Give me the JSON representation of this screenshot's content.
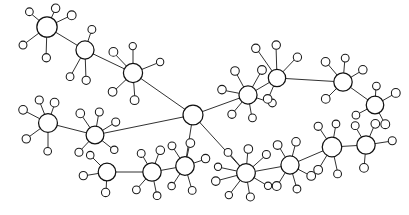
{
  "diagram": {
    "type": "node-link-graph",
    "background_color": "#ffffff",
    "edge_color": "#1a1a1a",
    "hub_fill": "#ffffff",
    "hub_stroke": "#111111",
    "leaf_fill": "#ffffff",
    "leaf_stroke": "#1a1a1a",
    "canvas": {
      "width": 409,
      "height": 215
    },
    "hub_radius": 9,
    "leaf_radius": 4,
    "hub_count": 17,
    "leaf_count": 96,
    "hubs": [
      {
        "id": "h1",
        "label": "hub-top-left",
        "cx": 47,
        "cy": 27,
        "r": 10
      },
      {
        "id": "h2",
        "label": "hub-upper-left-mid",
        "cx": 85,
        "cy": 50,
        "r": 9
      },
      {
        "id": "h3",
        "label": "hub-upper-center",
        "cx": 133,
        "cy": 73,
        "r": 9.5
      },
      {
        "id": "h4",
        "label": "hub-center",
        "cx": 193,
        "cy": 115,
        "r": 10
      },
      {
        "id": "h5",
        "label": "hub-upper-right-inner",
        "cx": 248,
        "cy": 95,
        "r": 9
      },
      {
        "id": "h6",
        "label": "hub-upper-right",
        "cx": 277,
        "cy": 78,
        "r": 9
      },
      {
        "id": "h7",
        "label": "hub-right-top",
        "cx": 343,
        "cy": 82,
        "r": 9
      },
      {
        "id": "h8",
        "label": "hub-far-right",
        "cx": 375,
        "cy": 105,
        "r": 8.5
      },
      {
        "id": "h9",
        "label": "hub-left-mid",
        "cx": 48,
        "cy": 123,
        "r": 9.5
      },
      {
        "id": "h10",
        "label": "hub-left-lower-mid",
        "cx": 95,
        "cy": 135,
        "r": 9
      },
      {
        "id": "h11",
        "label": "hub-bottom-left",
        "cx": 107,
        "cy": 172,
        "r": 9
      },
      {
        "id": "h12",
        "label": "hub-bottom-center-l",
        "cx": 152,
        "cy": 172,
        "r": 9
      },
      {
        "id": "h13",
        "label": "hub-bottom-center",
        "cx": 185,
        "cy": 166,
        "r": 9
      },
      {
        "id": "h14",
        "label": "hub-bottom-center-r",
        "cx": 246,
        "cy": 173,
        "r": 9.5
      },
      {
        "id": "h15",
        "label": "hub-bottom-right-mid",
        "cx": 290,
        "cy": 165,
        "r": 9
      },
      {
        "id": "h16",
        "label": "hub-bottom-right",
        "cx": 332,
        "cy": 147,
        "r": 9.5
      },
      {
        "id": "h17",
        "label": "hub-far-bottom-right",
        "cx": 366,
        "cy": 145,
        "r": 9
      }
    ],
    "hub_edges": [
      {
        "from": "h1",
        "to": "h2"
      },
      {
        "from": "h2",
        "to": "h3"
      },
      {
        "from": "h3",
        "to": "h4"
      },
      {
        "from": "h4",
        "to": "h5"
      },
      {
        "from": "h5",
        "to": "h6"
      },
      {
        "from": "h6",
        "to": "h7"
      },
      {
        "from": "h7",
        "to": "h8"
      },
      {
        "from": "h9",
        "to": "h10"
      },
      {
        "from": "h10",
        "to": "h4"
      },
      {
        "from": "h11",
        "to": "h12"
      },
      {
        "from": "h12",
        "to": "h13"
      },
      {
        "from": "h13",
        "to": "h4"
      },
      {
        "from": "h4",
        "to": "h14"
      },
      {
        "from": "h14",
        "to": "h15"
      },
      {
        "from": "h15",
        "to": "h16"
      },
      {
        "from": "h16",
        "to": "h17"
      }
    ],
    "leaves": [
      {
        "id": "l1",
        "hub": "h1",
        "cx": 29,
        "cy": 12
      },
      {
        "id": "l2",
        "hub": "h1",
        "cx": 56,
        "cy": 8
      },
      {
        "id": "l3",
        "hub": "h1",
        "cx": 72,
        "cy": 15
      },
      {
        "id": "l4",
        "hub": "h1",
        "cx": 23,
        "cy": 45
      },
      {
        "id": "l5",
        "hub": "h1",
        "cx": 46,
        "cy": 58
      },
      {
        "id": "l6",
        "hub": "h2",
        "cx": 92,
        "cy": 29
      },
      {
        "id": "l7",
        "hub": "h2",
        "cx": 70,
        "cy": 77
      },
      {
        "id": "l8",
        "hub": "h2",
        "cx": 86,
        "cy": 80
      },
      {
        "id": "l9",
        "hub": "h3",
        "cx": 113,
        "cy": 52
      },
      {
        "id": "l10",
        "hub": "h3",
        "cx": 133,
        "cy": 46
      },
      {
        "id": "l11",
        "hub": "h3",
        "cx": 160,
        "cy": 62
      },
      {
        "id": "l12",
        "hub": "h3",
        "cx": 113,
        "cy": 92
      },
      {
        "id": "l13",
        "hub": "h3",
        "cx": 135,
        "cy": 100
      },
      {
        "id": "l14",
        "hub": "h5",
        "cx": 235,
        "cy": 71
      },
      {
        "id": "l15",
        "hub": "h5",
        "cx": 262,
        "cy": 70
      },
      {
        "id": "l16",
        "hub": "h5",
        "cx": 222,
        "cy": 90
      },
      {
        "id": "l17",
        "hub": "h5",
        "cx": 272,
        "cy": 103
      },
      {
        "id": "l18",
        "hub": "h5",
        "cx": 232,
        "cy": 114
      },
      {
        "id": "l19",
        "hub": "h5",
        "cx": 252,
        "cy": 118
      },
      {
        "id": "l20",
        "hub": "h6",
        "cx": 256,
        "cy": 48
      },
      {
        "id": "l21",
        "hub": "h6",
        "cx": 276,
        "cy": 45
      },
      {
        "id": "l22",
        "hub": "h6",
        "cx": 297,
        "cy": 57
      },
      {
        "id": "l23",
        "hub": "h6",
        "cx": 268,
        "cy": 99
      },
      {
        "id": "l24",
        "hub": "h7",
        "cx": 326,
        "cy": 62
      },
      {
        "id": "l25",
        "hub": "h7",
        "cx": 345,
        "cy": 58
      },
      {
        "id": "l26",
        "hub": "h7",
        "cx": 363,
        "cy": 70
      },
      {
        "id": "l27",
        "hub": "h7",
        "cx": 326,
        "cy": 99
      },
      {
        "id": "l28",
        "hub": "h8",
        "cx": 376,
        "cy": 86
      },
      {
        "id": "l29",
        "hub": "h8",
        "cx": 396,
        "cy": 93
      },
      {
        "id": "l30",
        "hub": "h8",
        "cx": 356,
        "cy": 115
      },
      {
        "id": "l31",
        "hub": "h8",
        "cx": 385,
        "cy": 124
      },
      {
        "id": "l32",
        "hub": "h9",
        "cx": 39,
        "cy": 100
      },
      {
        "id": "l33",
        "hub": "h9",
        "cx": 55,
        "cy": 103
      },
      {
        "id": "l34",
        "hub": "h9",
        "cx": 23,
        "cy": 110
      },
      {
        "id": "l35",
        "hub": "h9",
        "cx": 26,
        "cy": 139
      },
      {
        "id": "l36",
        "hub": "h9",
        "cx": 48,
        "cy": 151
      },
      {
        "id": "l37",
        "hub": "h10",
        "cx": 80,
        "cy": 113
      },
      {
        "id": "l38",
        "hub": "h10",
        "cx": 99,
        "cy": 112
      },
      {
        "id": "l39",
        "hub": "h10",
        "cx": 116,
        "cy": 122
      },
      {
        "id": "l40",
        "hub": "h10",
        "cx": 79,
        "cy": 152
      },
      {
        "id": "l41",
        "hub": "h10",
        "cx": 114,
        "cy": 150
      },
      {
        "id": "l42",
        "hub": "h11",
        "cx": 90,
        "cy": 155
      },
      {
        "id": "l43",
        "hub": "h11",
        "cx": 83,
        "cy": 176
      },
      {
        "id": "l44",
        "hub": "h11",
        "cx": 106,
        "cy": 192
      },
      {
        "id": "l45",
        "hub": "h12",
        "cx": 141,
        "cy": 153
      },
      {
        "id": "l46",
        "hub": "h12",
        "cx": 160,
        "cy": 150
      },
      {
        "id": "l47",
        "hub": "h12",
        "cx": 136,
        "cy": 190
      },
      {
        "id": "l48",
        "hub": "h12",
        "cx": 157,
        "cy": 196
      },
      {
        "id": "l49",
        "hub": "h13",
        "cx": 172,
        "cy": 146
      },
      {
        "id": "l50",
        "hub": "h13",
        "cx": 190,
        "cy": 143
      },
      {
        "id": "l51",
        "hub": "h13",
        "cx": 206,
        "cy": 159
      },
      {
        "id": "l52",
        "hub": "h13",
        "cx": 172,
        "cy": 186
      },
      {
        "id": "l53",
        "hub": "h13",
        "cx": 192,
        "cy": 190
      },
      {
        "id": "l54",
        "hub": "h14",
        "cx": 228,
        "cy": 152
      },
      {
        "id": "l55",
        "hub": "h14",
        "cx": 248,
        "cy": 149
      },
      {
        "id": "l56",
        "hub": "h14",
        "cx": 266,
        "cy": 155
      },
      {
        "id": "l57",
        "hub": "h14",
        "cx": 218,
        "cy": 167
      },
      {
        "id": "l58",
        "hub": "h14",
        "cx": 216,
        "cy": 181
      },
      {
        "id": "l59",
        "hub": "h14",
        "cx": 229,
        "cy": 195
      },
      {
        "id": "l60",
        "hub": "h14",
        "cx": 250,
        "cy": 197
      },
      {
        "id": "l61",
        "hub": "h14",
        "cx": 268,
        "cy": 186
      },
      {
        "id": "l62",
        "hub": "h15",
        "cx": 278,
        "cy": 145
      },
      {
        "id": "l63",
        "hub": "h15",
        "cx": 296,
        "cy": 142
      },
      {
        "id": "l64",
        "hub": "h15",
        "cx": 277,
        "cy": 186
      },
      {
        "id": "l65",
        "hub": "h15",
        "cx": 297,
        "cy": 189
      },
      {
        "id": "l66",
        "hub": "h15",
        "cx": 311,
        "cy": 176
      },
      {
        "id": "l67",
        "hub": "h16",
        "cx": 318,
        "cy": 126
      },
      {
        "id": "l68",
        "hub": "h16",
        "cx": 336,
        "cy": 124
      },
      {
        "id": "l69",
        "hub": "h16",
        "cx": 318,
        "cy": 170
      },
      {
        "id": "l70",
        "hub": "h16",
        "cx": 338,
        "cy": 174
      },
      {
        "id": "l71",
        "hub": "h17",
        "cx": 355,
        "cy": 126
      },
      {
        "id": "l72",
        "hub": "h17",
        "cx": 375,
        "cy": 124
      },
      {
        "id": "l73",
        "hub": "h17",
        "cx": 392,
        "cy": 141
      },
      {
        "id": "l74",
        "hub": "h17",
        "cx": 364,
        "cy": 168
      }
    ]
  }
}
